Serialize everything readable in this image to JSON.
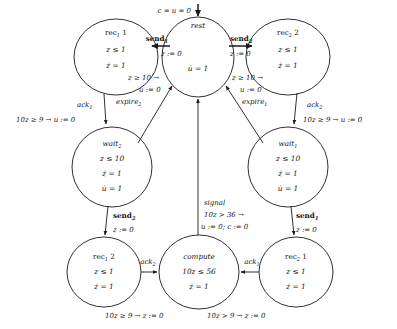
{
  "diagram": {
    "kind": "hybrid-automaton-state-diagram",
    "title": "",
    "nodes": [
      {
        "id": "rec1_1",
        "name_base": "rec",
        "name_sub": "1",
        "name_tail": " 1",
        "full_name": "rec1 1",
        "invariants": [
          "z ≤ 1",
          "ż = 1"
        ],
        "cx": 116,
        "cy": 57,
        "rx": 42,
        "ry": 38
      },
      {
        "id": "rest",
        "name_base": "rest",
        "name_sub": "",
        "name_tail": "",
        "full_name": "rest",
        "invariants": [
          "u̇ = 1"
        ],
        "cx": 198,
        "cy": 57,
        "rx": 36,
        "ry": 40
      },
      {
        "id": "rec2_2",
        "name_base": "rec",
        "name_sub": "2",
        "name_tail": " 2",
        "full_name": "rec2 2",
        "invariants": [
          "z ≤ 1",
          "ż = 1"
        ],
        "cx": 288,
        "cy": 57,
        "rx": 42,
        "ry": 38
      },
      {
        "id": "wait2",
        "name_base": "wait",
        "name_sub": "2",
        "name_tail": "",
        "full_name": "wait2",
        "invariants": [
          "z ≤ 10",
          "ż = 1",
          "u̇ = 1"
        ],
        "cx": 112,
        "cy": 167,
        "rx": 40,
        "ry": 40
      },
      {
        "id": "wait1",
        "name_base": "wait",
        "name_sub": "1",
        "name_tail": "",
        "full_name": "wait1",
        "invariants": [
          "z ≤ 10",
          "ż = 1",
          "u̇ = 1"
        ],
        "cx": 288,
        "cy": 167,
        "rx": 40,
        "ry": 40
      },
      {
        "id": "rec1_2",
        "name_base": "rec",
        "name_sub": "1",
        "name_tail": " 2",
        "full_name": "rec1 2",
        "invariants": [
          "z ≤ 1",
          "ż = 1"
        ],
        "cx": 104,
        "cy": 272,
        "rx": 37,
        "ry": 35
      },
      {
        "id": "compute",
        "name_base": "compute",
        "name_sub": "",
        "name_tail": "",
        "full_name": "compute",
        "invariants": [
          "10z ≤ 56",
          "ż = 1"
        ],
        "cx": 199,
        "cy": 272,
        "rx": 40,
        "ry": 37
      },
      {
        "id": "rec2_1",
        "name_base": "rec",
        "name_sub": "2",
        "name_tail": " 1",
        "full_name": "rec2 1",
        "invariants": [
          "z ≤ 1",
          "ż = 1"
        ],
        "cx": 296,
        "cy": 272,
        "rx": 37,
        "ry": 35
      }
    ],
    "initial_label": "c = u = 0",
    "edges": [
      {
        "id": "init",
        "from": "",
        "to": "rest",
        "event": "",
        "event_sub": "",
        "lines": [
          "c = u = 0"
        ]
      },
      {
        "id": "rest_to_rec1_1",
        "from": "rest",
        "to": "rec1_1",
        "event": "send",
        "event_sub": "1",
        "lines": [
          "z := 0"
        ]
      },
      {
        "id": "rest_to_rec2_2",
        "from": "rest",
        "to": "rec2_2",
        "event": "send",
        "event_sub": "2",
        "lines": [
          "z := 0"
        ]
      },
      {
        "id": "rec1_1_to_wait2",
        "from": "rec1_1",
        "to": "wait2",
        "event": "ack",
        "event_sub": "1",
        "lines": [
          "10z ≥ 9 → u := 0"
        ]
      },
      {
        "id": "rec2_2_to_wait1",
        "from": "rec2_2",
        "to": "wait1",
        "event": "ack",
        "event_sub": "2",
        "lines": [
          "10z ≥ 9 → u := 0"
        ]
      },
      {
        "id": "wait2_to_rest",
        "from": "wait2",
        "to": "rest",
        "event": "expire",
        "event_sub": "2",
        "lines": [
          "z ≥ 10 →",
          "u := 0"
        ]
      },
      {
        "id": "wait1_to_rest",
        "from": "wait1",
        "to": "rest",
        "event": "expire",
        "event_sub": "1",
        "lines": [
          "z ≥ 10 →",
          "u := 0"
        ]
      },
      {
        "id": "wait2_to_rec1_2",
        "from": "wait2",
        "to": "rec1_2",
        "event": "send",
        "event_sub": "2",
        "lines": [
          "z := 0"
        ]
      },
      {
        "id": "wait1_to_rec2_1",
        "from": "wait1",
        "to": "rec2_1",
        "event": "send",
        "event_sub": "1",
        "lines": [
          "z := 0"
        ]
      },
      {
        "id": "rec1_2_to_compute",
        "from": "rec1_2",
        "to": "compute",
        "event": "ack",
        "event_sub": "2",
        "lines": [
          "10z ≥ 9 → z := 0"
        ]
      },
      {
        "id": "rec2_1_to_compute",
        "from": "rec2_1",
        "to": "compute",
        "event": "ack",
        "event_sub": "1",
        "lines": [
          "10z > 9 → z := 0"
        ]
      },
      {
        "id": "compute_to_rest",
        "from": "compute",
        "to": "rest",
        "event": "signal",
        "event_sub": "",
        "lines": [
          "10z > 36 →",
          "u := 0; c := 0"
        ]
      }
    ],
    "labels": {
      "send1": "send",
      "send1_sub": "1",
      "send2": "send",
      "send2_sub": "2",
      "ack1": "ack",
      "ack1_sub": "1",
      "ack2": "ack",
      "ack2_sub": "2",
      "expire1": "expire",
      "expire1_sub": "1",
      "expire2": "expire",
      "expire2_sub": "2",
      "signal": "signal",
      "z_assign_0": "z := 0",
      "u_assign_0": "u := 0",
      "guard_z_ge_10": "z ≥ 10 →",
      "guard_10z_ge_9_u": "10z ≥ 9 → u := 0",
      "guard_10z_ge_9_z": "10z ≥ 9 → z := 0",
      "guard_10z_gt_9_z": "10z > 9 → z := 0",
      "guard_10z_gt_36": "10z > 36 →",
      "signal_assign": "u := 0; c := 0",
      "init_cond": "c = u = 0"
    },
    "colors": {
      "stroke": "#1a1a1a",
      "fill": "#ffffff",
      "text": "#141414",
      "background": "#ffffff"
    }
  }
}
